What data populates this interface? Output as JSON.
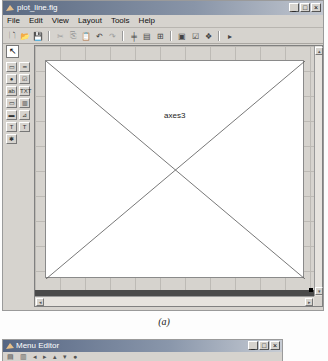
{
  "window": {
    "title": "plot_line.fig",
    "controls": {
      "minimize": "_",
      "maximize": "□",
      "close": "×"
    }
  },
  "menubar": {
    "items": [
      {
        "label": "File"
      },
      {
        "label": "Edit"
      },
      {
        "label": "View"
      },
      {
        "label": "Layout"
      },
      {
        "label": "Tools"
      },
      {
        "label": "Help"
      }
    ]
  },
  "toolbar": {
    "buttons": [
      {
        "icon": "new-file-icon",
        "glyph": "🗋"
      },
      {
        "icon": "open-icon",
        "glyph": "📂"
      },
      {
        "icon": "save-icon",
        "glyph": "💾"
      },
      {
        "icon": "cut-icon",
        "glyph": "✂",
        "disabled": true
      },
      {
        "icon": "copy-icon",
        "glyph": "⎘",
        "disabled": true
      },
      {
        "icon": "paste-icon",
        "glyph": "📋"
      },
      {
        "icon": "undo-icon",
        "glyph": "↶"
      },
      {
        "icon": "redo-icon",
        "glyph": "↷",
        "disabled": true
      },
      {
        "icon": "align-objects-icon",
        "glyph": "╪"
      },
      {
        "icon": "menu-editor-icon",
        "glyph": "▤"
      },
      {
        "icon": "tab-order-editor-icon",
        "glyph": "⊞"
      },
      {
        "icon": "m-file-editor-icon",
        "glyph": "▣"
      },
      {
        "icon": "property-inspector-icon",
        "glyph": "☑"
      },
      {
        "icon": "object-browser-icon",
        "glyph": "❖"
      },
      {
        "icon": "run-icon",
        "glyph": "▸"
      }
    ]
  },
  "palette": {
    "select_glyph": "↖",
    "items": [
      {
        "name": "push-button",
        "glyph": "▭"
      },
      {
        "name": "slider",
        "glyph": "━"
      },
      {
        "name": "radio-button",
        "glyph": "●"
      },
      {
        "name": "check-box",
        "glyph": "☑"
      },
      {
        "name": "edit-text",
        "glyph": "ab"
      },
      {
        "name": "static-text",
        "glyph": "TXT"
      },
      {
        "name": "popup-menu",
        "glyph": "▭"
      },
      {
        "name": "listbox",
        "glyph": "▥"
      },
      {
        "name": "toggle-button",
        "glyph": "▬"
      },
      {
        "name": "axes",
        "glyph": "⊿"
      },
      {
        "name": "panel",
        "glyph": "T"
      },
      {
        "name": "button-group",
        "glyph": "T"
      },
      {
        "name": "activex-control",
        "glyph": "✱"
      }
    ]
  },
  "canvas": {
    "axes_tag": "axes3"
  },
  "caption": "(a)",
  "window2": {
    "title": "Menu Editor"
  }
}
